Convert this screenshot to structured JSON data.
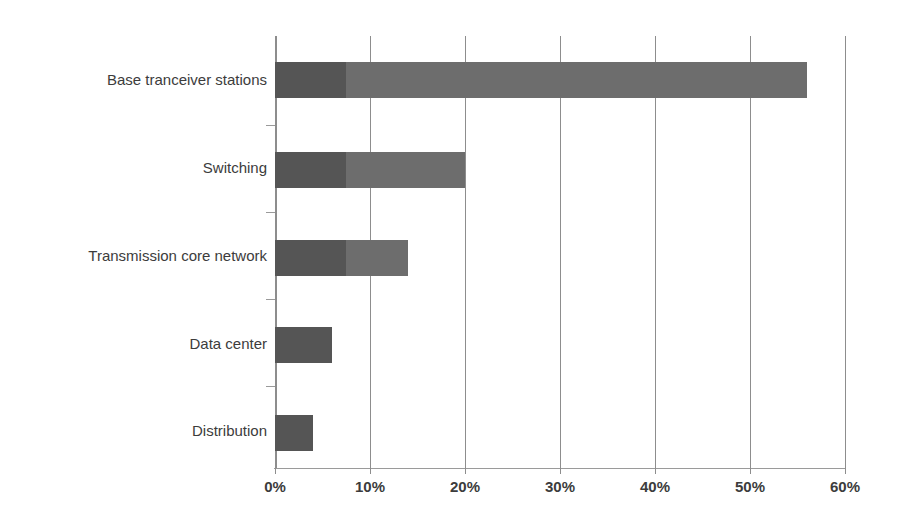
{
  "chart_data": {
    "type": "bar",
    "orientation": "horizontal",
    "title": "",
    "xlabel": "",
    "ylabel": "",
    "xlim": [
      0,
      60
    ],
    "xticks": [
      0,
      10,
      20,
      30,
      40,
      50,
      60
    ],
    "xticklabels": [
      "0%",
      "10%",
      "20%",
      "30%",
      "40%",
      "50%",
      "60%"
    ],
    "grid": "vertical",
    "legend": "none",
    "categories": [
      "Base tranceiver stations",
      "Switching",
      "Transmission core network",
      "Data center",
      "Distribution"
    ],
    "values": [
      56,
      20,
      14,
      6,
      4
    ],
    "stacked_segments": [
      {
        "category": "Base tranceiver stations",
        "dark": 7.5,
        "light": 48.5,
        "total": 56
      },
      {
        "category": "Switching",
        "dark": 7.5,
        "light": 12.5,
        "total": 20
      },
      {
        "category": "Transmission core network",
        "dark": 7.5,
        "light": 6.5,
        "total": 14
      },
      {
        "category": "Data center",
        "dark": 6,
        "light": 0,
        "total": 6
      },
      {
        "category": "Distribution",
        "dark": 4,
        "light": 0,
        "total": 4
      }
    ],
    "colors": {
      "dark_segment": "#555555",
      "light_segment": "#6d6d6d",
      "gridline": "#8d8d8d",
      "axis": "#9a9a9a",
      "text": "#3c3c3c",
      "background": "#ffffff"
    }
  },
  "axis": {
    "tick_labels": [
      "0%",
      "10%",
      "20%",
      "30%",
      "40%",
      "50%",
      "60%"
    ]
  },
  "categories": {
    "items": [
      {
        "label": "Base tranceiver stations"
      },
      {
        "label": "Switching"
      },
      {
        "label": "Transmission core network"
      },
      {
        "label": "Data center"
      },
      {
        "label": "Distribution"
      }
    ]
  }
}
